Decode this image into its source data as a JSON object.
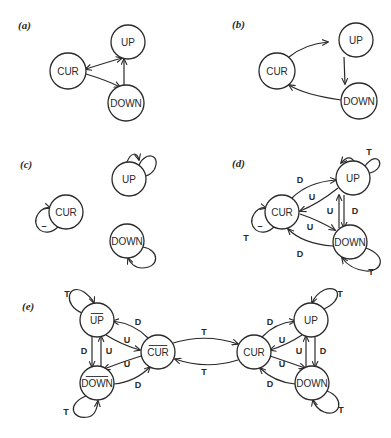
{
  "panels": [
    {
      "id": "a",
      "label": "(a)",
      "label_pos": [
        18,
        29
      ],
      "nodes": [
        {
          "id": "CUR",
          "text": "CUR",
          "x": 68,
          "y": 71,
          "r": 18,
          "bar": false
        },
        {
          "id": "UP",
          "text": "UP",
          "x": 128,
          "y": 42,
          "r": 17,
          "bar": false
        },
        {
          "id": "DOWN",
          "text": "DOWN",
          "x": 126,
          "y": 103,
          "r": 18,
          "bar": false
        }
      ],
      "edges": [
        {
          "from": "CUR",
          "to": "UP",
          "path": "M86,69 Q108,62 122,58",
          "arrow_end": true,
          "arrow_start": true,
          "label": ""
        },
        {
          "from": "CUR",
          "to": "DOWN",
          "path": "M86,74 Q106,80 120,87",
          "arrow_end": true,
          "arrow_start": false,
          "label": ""
        },
        {
          "from": "DOWN",
          "to": "UP",
          "path": "M124,85 L124,59",
          "arrow_end": true,
          "arrow_start": false,
          "label": ""
        }
      ]
    },
    {
      "id": "b",
      "label": "(b)",
      "label_pos": [
        232,
        28
      ],
      "nodes": [
        {
          "id": "CUR",
          "text": "CUR",
          "x": 277,
          "y": 71,
          "r": 18,
          "bar": false
        },
        {
          "id": "UP",
          "text": "UP",
          "x": 356,
          "y": 40,
          "r": 17,
          "bar": false
        },
        {
          "id": "DOWN",
          "text": "DOWN",
          "x": 359,
          "y": 101,
          "r": 18,
          "bar": false
        }
      ],
      "edges": [
        {
          "from": "CUR",
          "to": "UP",
          "path": "M289,57 Q305,44 328,42",
          "arrow_end": true,
          "arrow_start": false,
          "label": ""
        },
        {
          "from": "UP",
          "to": "DOWN",
          "path": "M344,57 L345,84",
          "arrow_end": true,
          "arrow_start": false,
          "label": ""
        },
        {
          "from": "DOWN",
          "to": "CUR",
          "path": "M341,100 Q305,95 289,85",
          "arrow_end": true,
          "arrow_start": false,
          "label": ""
        }
      ]
    },
    {
      "id": "c",
      "label": "(c)",
      "label_pos": [
        20,
        168
      ],
      "nodes": [
        {
          "id": "CUR",
          "text": "CUR",
          "x": 66,
          "y": 212,
          "r": 17,
          "bar": false
        },
        {
          "id": "UP",
          "text": "UP",
          "x": 129,
          "y": 179,
          "r": 17,
          "bar": false
        },
        {
          "id": "DOWN",
          "text": "DOWN",
          "x": 127,
          "y": 241,
          "r": 17,
          "bar": false
        }
      ],
      "edges": [
        {
          "from": "CUR",
          "to": "CUR",
          "path": "M58,227 C44,240 30,226 38,214 C42,208 47,207 50,208",
          "arrow_end": true,
          "arrow_start": false,
          "label": "–",
          "label_pos": [
            44,
            226
          ]
        },
        {
          "from": "UP",
          "to": "UP",
          "path": "M139,165 C146,150 162,155 154,170 C152,173 149,175 146,176",
          "arrow_end": false,
          "arrow_start": false,
          "label": ""
        },
        {
          "from": "UP",
          "to": "UP",
          "path": "M127,162 C131,152 137,152 139,160",
          "arrow_end": true,
          "arrow_start": false,
          "label": ""
        },
        {
          "from": "DOWN",
          "to": "DOWN",
          "path": "M143,247 C160,250 160,268 142,268 C135,268 130,263 128,258",
          "arrow_end": true,
          "arrow_start": false,
          "label": ""
        }
      ]
    },
    {
      "id": "d",
      "label": "(d)",
      "label_pos": [
        232,
        167
      ],
      "nodes": [
        {
          "id": "CUR",
          "text": "CUR",
          "x": 282,
          "y": 212,
          "r": 17,
          "bar": false
        },
        {
          "id": "UP",
          "text": "UP",
          "x": 353,
          "y": 178,
          "r": 17,
          "bar": false
        },
        {
          "id": "DOWN",
          "text": "DOWN",
          "x": 350,
          "y": 242,
          "r": 17,
          "bar": false
        }
      ],
      "edges": [
        {
          "from": "CUR",
          "to": "UP",
          "path": "M292,198 Q308,182 336,180",
          "arrow_end": true,
          "arrow_start": false,
          "label": "D",
          "label_pos": [
            300,
            180
          ]
        },
        {
          "from": "UP",
          "to": "CUR",
          "path": "M338,188 Q318,204 300,211",
          "arrow_end": true,
          "arrow_start": false,
          "label": "U",
          "label_pos": [
            312,
            197
          ]
        },
        {
          "from": "CUR",
          "to": "DOWN",
          "path": "M300,214 Q318,220 335,230",
          "arrow_end": true,
          "arrow_start": false,
          "label": "U",
          "label_pos": [
            310,
            227
          ]
        },
        {
          "from": "DOWN",
          "to": "CUR",
          "path": "M333,246 Q303,244 288,229",
          "arrow_end": true,
          "arrow_start": false,
          "label": "D",
          "label_pos": [
            300,
            254
          ]
        },
        {
          "from": "DOWN",
          "to": "UP",
          "path": "M339,228 L339,195",
          "arrow_end": true,
          "arrow_start": false,
          "label": "U",
          "label_pos": [
            330,
            211
          ]
        },
        {
          "from": "UP",
          "to": "DOWN",
          "path": "M344,195 L344,228",
          "arrow_end": true,
          "arrow_start": false,
          "label": "D",
          "label_pos": [
            355,
            211
          ]
        },
        {
          "from": "UP",
          "to": "UP",
          "path": "M365,166 C378,148 388,168 370,173 C366,174 360,170 356,164 C352,157 348,155 341,163",
          "arrow_end": true,
          "arrow_start": false,
          "label": "T",
          "label_pos": [
            369,
            152
          ]
        },
        {
          "from": "DOWN",
          "to": "DOWN",
          "path": "M366,248 C388,256 382,272 366,271 C356,270 348,266 342,258",
          "arrow_end": true,
          "arrow_start": false,
          "label": "T",
          "label_pos": [
            371,
            272
          ]
        },
        {
          "from": "CUR",
          "to": "CUR",
          "path": "M274,227 C260,240 246,226 254,214 C258,208 262,207 266,208",
          "arrow_end": true,
          "arrow_start": false,
          "label": "–",
          "label_pos": [
            260,
            226
          ]
        }
      ],
      "extra_labels": [
        {
          "text": "T",
          "pos": [
            246,
            238
          ]
        }
      ]
    },
    {
      "id": "e",
      "label": "(e)",
      "label_pos": [
        22,
        310
      ],
      "nodes": [
        {
          "id": "UPbar",
          "text": "UP",
          "x": 97,
          "y": 320,
          "r": 17,
          "bar": true
        },
        {
          "id": "DOWNbar",
          "text": "DOWN",
          "x": 97,
          "y": 383,
          "r": 17,
          "bar": true
        },
        {
          "id": "CURbar",
          "text": "CUR",
          "x": 158,
          "y": 352,
          "r": 17,
          "bar": true
        },
        {
          "id": "CUR",
          "text": "CUR",
          "x": 254,
          "y": 352,
          "r": 17,
          "bar": false
        },
        {
          "id": "UP",
          "text": "UP",
          "x": 311,
          "y": 320,
          "r": 17,
          "bar": false
        },
        {
          "id": "DOWN",
          "text": "DOWN",
          "x": 312,
          "y": 383,
          "r": 17,
          "bar": false
        }
      ],
      "edges": [
        {
          "from": "CURbar",
          "to": "UPbar",
          "path": "M148,338 Q135,324 113,321",
          "arrow_end": true,
          "arrow_start": false,
          "label": "D",
          "label_pos": [
            138,
            322
          ]
        },
        {
          "from": "UPbar",
          "to": "CURbar",
          "path": "M106,335 Q122,345 140,350",
          "arrow_end": true,
          "arrow_start": false,
          "label": "U",
          "label_pos": [
            127,
            340
          ]
        },
        {
          "from": "CURbar",
          "to": "DOWNbar",
          "path": "M141,356 Q122,362 104,369",
          "arrow_end": true,
          "arrow_start": false,
          "label": "U",
          "label_pos": [
            127,
            364
          ]
        },
        {
          "from": "DOWNbar",
          "to": "CURbar",
          "path": "M114,384 Q135,382 150,367",
          "arrow_end": true,
          "arrow_start": false,
          "label": "D",
          "label_pos": [
            138,
            385
          ]
        },
        {
          "from": "UPbar",
          "to": "DOWNbar",
          "path": "M92,336 L92,367",
          "arrow_end": true,
          "arrow_start": false,
          "label": "D",
          "label_pos": [
            84,
            351
          ]
        },
        {
          "from": "DOWNbar",
          "to": "UPbar",
          "path": "M101,367 L101,336",
          "arrow_end": true,
          "arrow_start": false,
          "label": "U",
          "label_pos": [
            109,
            351
          ]
        },
        {
          "from": "UPbar",
          "to": "UPbar",
          "path": "M82,313 C62,305 68,282 84,292 C88,295 92,298 94,303",
          "arrow_end": true,
          "arrow_start": false,
          "label": "T",
          "label_pos": [
            67,
            294
          ]
        },
        {
          "from": "DOWNbar",
          "to": "DOWNbar",
          "path": "M86,396 C66,404 72,420 88,417 C94,416 97,410 98,401",
          "arrow_end": true,
          "arrow_start": false,
          "label": "T",
          "label_pos": [
            66,
            412
          ]
        },
        {
          "from": "CURbar",
          "to": "CUR",
          "path": "M173,343 Q206,333 238,344",
          "arrow_end": true,
          "arrow_start": false,
          "label": "T",
          "label_pos": [
            204,
            332
          ]
        },
        {
          "from": "CUR",
          "to": "CURbar",
          "path": "M238,360 Q206,370 175,359",
          "arrow_end": true,
          "arrow_start": false,
          "label": "T",
          "label_pos": [
            204,
            372
          ]
        },
        {
          "from": "CUR",
          "to": "UP",
          "path": "M262,337 Q275,323 295,321",
          "arrow_end": true,
          "arrow_start": false,
          "label": "D",
          "label_pos": [
            270,
            322
          ]
        },
        {
          "from": "UP",
          "to": "CUR",
          "path": "M302,335 Q287,345 270,350",
          "arrow_end": true,
          "arrow_start": false,
          "label": "U",
          "label_pos": [
            282,
            340
          ]
        },
        {
          "from": "CUR",
          "to": "DOWN",
          "path": "M270,356 Q288,362 305,368",
          "arrow_end": true,
          "arrow_start": false,
          "label": "U",
          "label_pos": [
            282,
            364
          ]
        },
        {
          "from": "DOWN",
          "to": "CUR",
          "path": "M295,384 Q274,382 260,368",
          "arrow_end": true,
          "arrow_start": false,
          "label": "D",
          "label_pos": [
            270,
            384
          ]
        },
        {
          "from": "DOWN",
          "to": "UP",
          "path": "M306,367 L306,336",
          "arrow_end": true,
          "arrow_start": false,
          "label": "U",
          "label_pos": [
            299,
            351
          ]
        },
        {
          "from": "UP",
          "to": "DOWN",
          "path": "M315,336 L315,367",
          "arrow_end": true,
          "arrow_start": false,
          "label": "D",
          "label_pos": [
            323,
            351
          ]
        },
        {
          "from": "UP",
          "to": "UP",
          "path": "M324,309 C344,300 340,284 324,290 C318,293 314,298 312,303",
          "arrow_end": true,
          "arrow_start": false,
          "label": "T",
          "label_pos": [
            340,
            294
          ]
        },
        {
          "from": "DOWN",
          "to": "DOWN",
          "path": "M327,391 C346,398 340,418 324,412 C318,410 314,404 313,400",
          "arrow_end": true,
          "arrow_start": false,
          "label": "T",
          "label_pos": [
            341,
            410
          ]
        }
      ]
    }
  ]
}
